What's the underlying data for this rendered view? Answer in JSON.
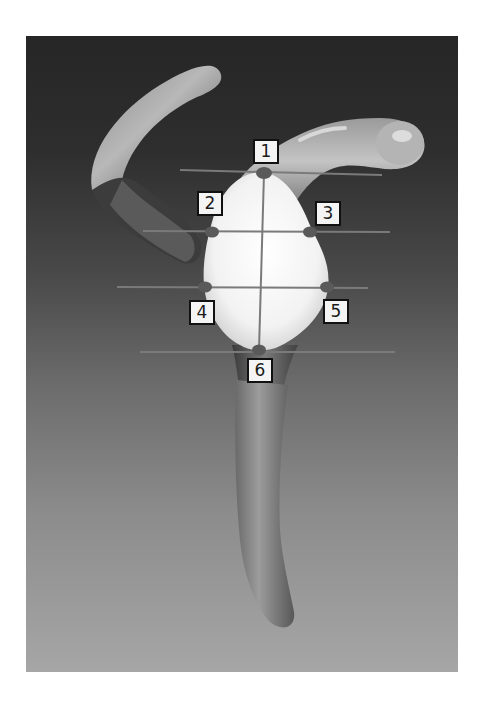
{
  "figure": {
    "background_gradient": [
      "#262626",
      "#4a4a4a",
      "#6c6c6c",
      "#a6a6a6"
    ],
    "bone_color_light": "#f5f5f5",
    "bone_color_shaded": "#8a8a8a",
    "landmark_color": "#5a5a5a",
    "line_color": "#7a7a7a",
    "markers": [
      {
        "label": "1",
        "box": {
          "x": 253,
          "y": 139
        },
        "dot": {
          "x": 264,
          "y": 173
        }
      },
      {
        "label": "2",
        "box": {
          "x": 197,
          "y": 191
        },
        "dot": {
          "x": 212,
          "y": 232
        }
      },
      {
        "label": "3",
        "box": {
          "x": 315,
          "y": 201
        },
        "dot": {
          "x": 310,
          "y": 232
        }
      },
      {
        "label": "4",
        "box": {
          "x": 189,
          "y": 300
        },
        "dot": {
          "x": 205,
          "y": 287
        }
      },
      {
        "label": "5",
        "box": {
          "x": 323,
          "y": 299
        },
        "dot": {
          "x": 327,
          "y": 287
        }
      },
      {
        "label": "6",
        "box": {
          "x": 247,
          "y": 358
        },
        "dot": {
          "x": 259,
          "y": 350
        }
      }
    ],
    "reference_lines": [
      {
        "name": "superior-line",
        "x1": 180,
        "y1": 170,
        "x2": 382,
        "y2": 175
      },
      {
        "name": "upper-width-line",
        "x1": 143,
        "y1": 231,
        "x2": 390,
        "y2": 232
      },
      {
        "name": "lower-width-line",
        "x1": 117,
        "y1": 287,
        "x2": 368,
        "y2": 288
      },
      {
        "name": "inferior-line",
        "x1": 140,
        "y1": 352,
        "x2": 395,
        "y2": 352
      },
      {
        "name": "vertical-axis",
        "x1": 264,
        "y1": 173,
        "x2": 259,
        "y2": 350
      }
    ]
  }
}
